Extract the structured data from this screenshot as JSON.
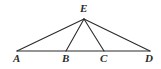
{
  "figure": {
    "type": "geometry-diagram",
    "canvas": {
      "width": 161,
      "height": 69,
      "background": "#ffffff"
    },
    "style": {
      "line_color": "#2b2b2b",
      "line_width": 1.1,
      "label_color": "#2b2b2b",
      "label_font_size": 11
    },
    "points": [
      {
        "name": "A",
        "label": "A",
        "x": 17,
        "y": 51,
        "label_x": 13,
        "label_y": 53
      },
      {
        "name": "B",
        "label": "B",
        "x": 66,
        "y": 51,
        "label_x": 62,
        "label_y": 53
      },
      {
        "name": "C",
        "label": "C",
        "x": 104,
        "y": 51,
        "label_x": 100,
        "label_y": 53
      },
      {
        "name": "D",
        "label": "D",
        "x": 150,
        "y": 51,
        "label_x": 145,
        "label_y": 53
      },
      {
        "name": "E",
        "label": "E",
        "x": 84,
        "y": 19,
        "label_x": 80,
        "label_y": 3
      }
    ],
    "segments": [
      {
        "name": "AD",
        "from": "A",
        "to": "D",
        "role": "base"
      },
      {
        "name": "EA",
        "from": "E",
        "to": "A",
        "role": "side"
      },
      {
        "name": "EB",
        "from": "E",
        "to": "B",
        "role": "cevian"
      },
      {
        "name": "EC",
        "from": "E",
        "to": "C",
        "role": "cevian"
      },
      {
        "name": "ED",
        "from": "E",
        "to": "D",
        "role": "side"
      }
    ]
  }
}
